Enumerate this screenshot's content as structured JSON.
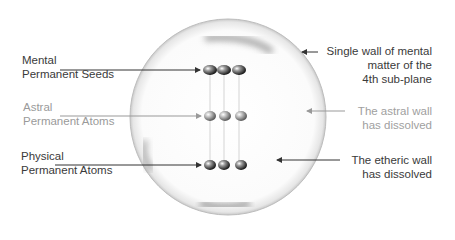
{
  "diagram": {
    "left_labels": [
      {
        "line1": "Mental",
        "line2": "Permanent Seeds"
      },
      {
        "line1": "Astral",
        "line2": "Permanent Atoms"
      },
      {
        "line1": "Physical",
        "line2": "Permanent Atoms"
      }
    ],
    "right_labels": [
      {
        "line1": "Single wall of mental",
        "line2": "matter of the",
        "line3": "4th sub-plane"
      },
      {
        "line1": "The astral wall",
        "line2": "has dissolved"
      },
      {
        "line1": "The etheric wall",
        "line2": "has dissolved"
      }
    ],
    "colors": {
      "dark_text": "#3a3a3a",
      "faint_text": "#9a9a9a",
      "line": "#333333"
    }
  }
}
